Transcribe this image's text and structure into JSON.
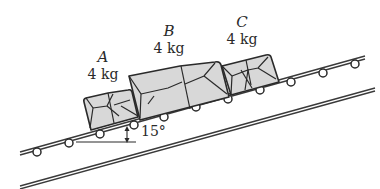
{
  "diagram": {
    "incline_angle_label": "15°",
    "packages": [
      {
        "letter": "A",
        "mass": "4 kg"
      },
      {
        "letter": "B",
        "mass": "4 kg"
      },
      {
        "letter": "C",
        "mass": "4 kg"
      }
    ],
    "colors": {
      "package_fill": "#d8d8d8",
      "line": "#2a2a2a",
      "background": "#ffffff"
    }
  }
}
